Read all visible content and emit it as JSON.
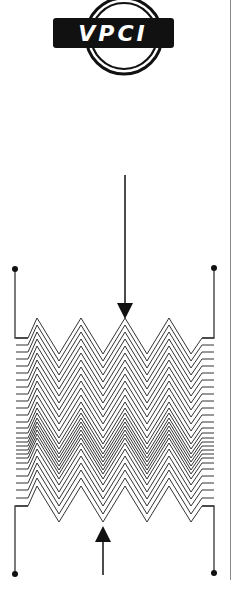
{
  "logo": {
    "text": "VPCI",
    "bar_color": "#111111",
    "text_color": "#ffffff",
    "ring_color": "#111111"
  },
  "diagram": {
    "line_color": "#333333",
    "arrow_color": "#111111",
    "top_arrow": {
      "x": 125,
      "y_start": 175,
      "tip_y": 319,
      "direction": "down"
    },
    "bottom_arrow": {
      "x": 103,
      "y_end": 575,
      "tip_y": 526,
      "direction": "up"
    },
    "terminals": [
      {
        "name": "top-left",
        "x": 15,
        "y": 269
      },
      {
        "name": "top-right",
        "x": 214,
        "y": 268
      },
      {
        "name": "bottom-left",
        "x": 15,
        "y": 574
      },
      {
        "name": "bottom-right",
        "x": 214,
        "y": 573
      }
    ],
    "grid": {
      "x_start": 28,
      "x_end": 202,
      "half_period": 22,
      "amplitude": 36,
      "first_peak_x": 37,
      "line_offsets": [
        0,
        7,
        14,
        21,
        28,
        35,
        42,
        49,
        56,
        63,
        70,
        77,
        84,
        90,
        95,
        100,
        104,
        108,
        112,
        116,
        120,
        125,
        131,
        138,
        145,
        152,
        160,
        168
      ]
    }
  }
}
